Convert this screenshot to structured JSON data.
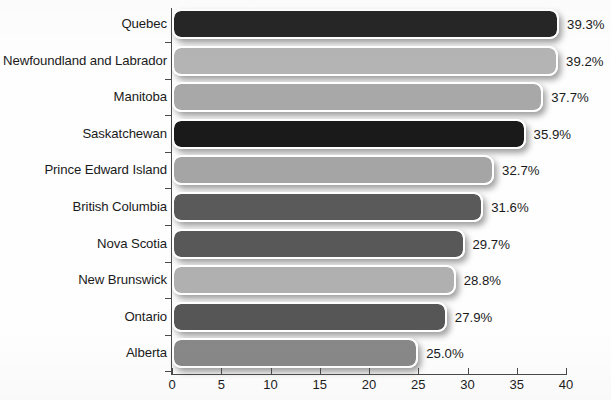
{
  "chart_data": {
    "type": "bar",
    "orientation": "horizontal",
    "title": "",
    "subtitle": "",
    "xlabel": "",
    "ylabel": "",
    "xlim": [
      0,
      40
    ],
    "xticks": [
      0,
      5,
      10,
      15,
      20,
      25,
      30,
      35,
      40
    ],
    "xtick_labels": [
      "0",
      "5",
      "10",
      "15",
      "20",
      "25",
      "30",
      "35",
      "40"
    ],
    "grid": false,
    "legend": false,
    "value_suffix": "%",
    "categories": [
      "Quebec",
      "Newfoundland and Labrador",
      "Manitoba",
      "Saskatchewan",
      "Prince Edward Island",
      "British Columbia",
      "Nova Scotia",
      "New Brunswick",
      "Ontario",
      "Alberta"
    ],
    "values": [
      39.3,
      39.2,
      37.7,
      35.9,
      32.7,
      31.6,
      29.7,
      28.8,
      27.9,
      25.0
    ],
    "value_labels": [
      "39.3%",
      "39.2%",
      "37.7%",
      "35.9%",
      "32.7%",
      "31.6%",
      "29.7%",
      "28.8%",
      "27.9%",
      "25.0%"
    ],
    "bar_colors": [
      "#262626",
      "#b4b4b4",
      "#a8a8a8",
      "#1a1a1a",
      "#a5a5a5",
      "#5a5a5a",
      "#585858",
      "#b0b0b0",
      "#565656",
      "#888888"
    ],
    "bar_outline_color": "#ffffff",
    "axis_color": "#4a4a4a",
    "background_color": "#fefefe",
    "text_color": "#1a1a1a"
  }
}
